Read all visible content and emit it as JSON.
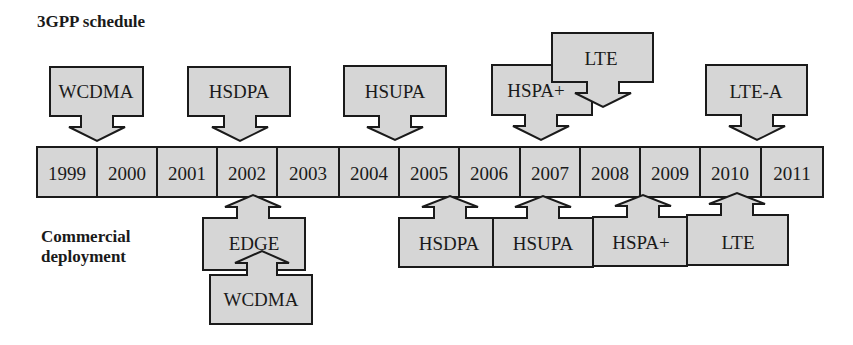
{
  "titles": {
    "top": "3GPP schedule",
    "bottom_line1": "Commercial",
    "bottom_line2": "deployment"
  },
  "colors": {
    "fill": "#d6d6d6",
    "stroke": "#1a1a1a",
    "text": "#1a1a1a",
    "background": "#ffffff"
  },
  "timeline": {
    "years": [
      "1999",
      "2000",
      "2001",
      "2002",
      "2003",
      "2004",
      "2005",
      "2006",
      "2007",
      "2008",
      "2009",
      "2010",
      "2011"
    ]
  },
  "schedule_3gpp": [
    {
      "label": "WCDMA",
      "year": "1999"
    },
    {
      "label": "HSDPA",
      "year": "2002"
    },
    {
      "label": "HSUPA",
      "year": "2004"
    },
    {
      "label": "HSPA+",
      "year": "2007"
    },
    {
      "label": "LTE",
      "year": "2008"
    },
    {
      "label": "LTE-A",
      "year": "2010"
    }
  ],
  "commercial_deployment": [
    {
      "label": "EDGE",
      "year": "2002"
    },
    {
      "label": "WCDMA",
      "year": "2002"
    },
    {
      "label": "HSDPA",
      "year": "2005"
    },
    {
      "label": "HSUPA",
      "year": "2007"
    },
    {
      "label": "HSPA+",
      "year": "2009"
    },
    {
      "label": "LTE",
      "year": "2010"
    }
  ]
}
